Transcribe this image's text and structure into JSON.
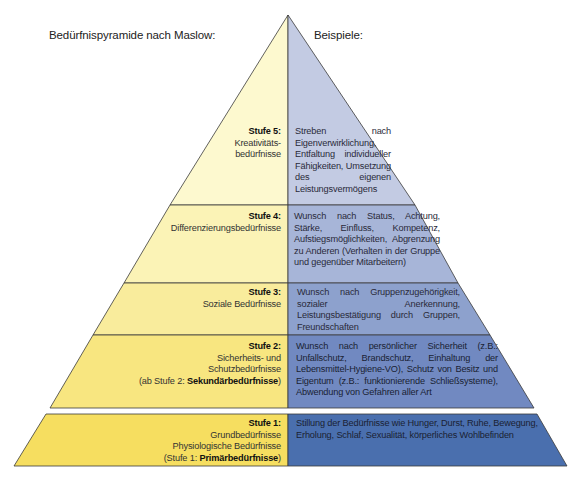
{
  "header": {
    "left_title": "Bedürfnispyramide nach Maslow:",
    "right_title": "Beispiele:"
  },
  "colors": {
    "yellow_levels": [
      "#fdf9cf",
      "#fbf3b6",
      "#f9ec9c",
      "#f8e680",
      "#f6de60"
    ],
    "blue_levels": [
      "#c3cbe3",
      "#a7b5d8",
      "#8da1cd",
      "#7189c1",
      "#4a6fae"
    ],
    "outline": "#3a3a3a"
  },
  "levels": [
    {
      "stufe": "Stufe 5:",
      "name_lines": [
        "Kreativitäts-",
        "bedürfnisse"
      ],
      "examples": "Streben nach Eigenverwirklichung, Entfaltung individueller Fähigkeiten, Umsetzung des eigenen Leistungsvermögens"
    },
    {
      "stufe": "Stufe 4:",
      "name_lines": [
        "Differenzierungsbedürfnisse"
      ],
      "examples": "Wunsch nach Status, Achtung, Stärke, Einfluss, Kompetenz, Aufstiegsmöglichkeiten, Abgrenzung zu Anderen (Verhalten in der Gruppe und gegenüber Mitarbeitern)"
    },
    {
      "stufe": "Stufe 3:",
      "name_lines": [
        "Soziale Bedürfnisse"
      ],
      "examples": "Wunsch nach Gruppenzugehörigkeit, sozialer Anerkennung, Leistungsbestätigung durch Gruppen, Freundschaften"
    },
    {
      "stufe": "Stufe 2:",
      "name_lines": [
        "Sicherheits- und",
        "Schutzbedürfnisse"
      ],
      "note_prefix": "(ab Stufe 2: ",
      "note_bold": "Sekundärbedürfnisse",
      "note_suffix": ")",
      "examples": "Wunsch nach persönlicher Sicherheit (z.B.: Unfallschutz, Brandschutz, Einhaltung der Lebensmittel-Hygiene-VO), Schutz von Besitz und Eigentum (z.B.: funktionierende Schließsysteme), Abwendung von Gefahren aller Art"
    },
    {
      "stufe": "Stufe 1:",
      "name_lines": [
        "Grundbedürfnisse",
        "Physiologische Bedürfnisse"
      ],
      "note_prefix": "(Stufe 1: ",
      "note_bold": "Primärbedürfnisse",
      "note_suffix": ")",
      "examples": "Stillung der Bedürfnisse wie Hunger, Durst, Ruhe, Bewegung, Erholung, Schlaf, Sexualität, körperliches Wohlbefinden"
    }
  ]
}
